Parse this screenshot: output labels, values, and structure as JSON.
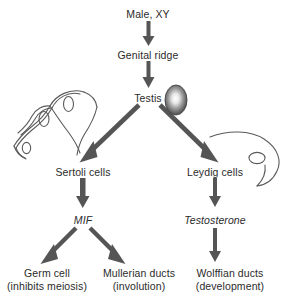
{
  "figure": {
    "domain": "diagram",
    "background_color": "#ffffff",
    "arrow_color": "#555555",
    "text_color": "#2b2b2b",
    "cell_outline_color": "#5a5a5a",
    "nodes": {
      "male_xy": "Male, XY",
      "genital_ridge": "Genital ridge",
      "testis": "Testis",
      "sertoli_cells": "Sertoli cells",
      "leydig_cells": "Leydig cells",
      "mif": "MIF",
      "testosterone": "Testosterone",
      "germ_cell_line1": "Germ cell",
      "germ_cell_line2": "(inhibits meiosis)",
      "mullerian_line1": "Mullerian ducts",
      "mullerian_line2": "(involution)",
      "wolffian_line1": "Wolffian ducts",
      "wolffian_line2": "(development)"
    },
    "illustrations": {
      "testis_organ": "testis-oval-shaded",
      "sertoli_drawing": "sertoli-cell-outline-drawing",
      "leydig_drawing": "leydig-cell-outline-drawing"
    },
    "edges": [
      {
        "from": "Male, XY",
        "to": "Genital ridge",
        "style": "thin-vertical"
      },
      {
        "from": "Genital ridge",
        "to": "Testis",
        "style": "thin-vertical"
      },
      {
        "from": "Testis",
        "to": "Sertoli cells",
        "style": "thick-diagonal-left"
      },
      {
        "from": "Testis",
        "to": "Leydig cells",
        "style": "thick-diagonal-right"
      },
      {
        "from": "Sertoli cells",
        "to": "MIF",
        "style": "thick-vertical"
      },
      {
        "from": "Leydig cells",
        "to": "Testosterone",
        "style": "thin-vertical"
      },
      {
        "from": "MIF",
        "to": "Germ cell (inhibits meiosis)",
        "style": "thick-diagonal-left"
      },
      {
        "from": "MIF",
        "to": "Mullerian ducts (involution)",
        "style": "thick-diagonal-right"
      },
      {
        "from": "Testosterone",
        "to": "Wolffian ducts (development)",
        "style": "thin-vertical"
      }
    ]
  }
}
